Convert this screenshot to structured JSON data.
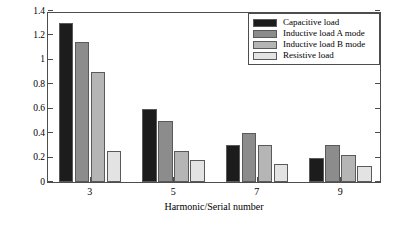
{
  "chart_data": {
    "type": "bar",
    "title": "",
    "xlabel": "Harmonic/Serial number",
    "ylabel": "Harmonic/A",
    "categories": [
      "3",
      "5",
      "7",
      "9"
    ],
    "ylim": [
      0,
      1.4
    ],
    "yticks": [
      "0",
      "0.2",
      "0.4",
      "0.6",
      "0.8",
      "1",
      "1.2",
      "1.4"
    ],
    "ytick_values": [
      0,
      0.2,
      0.4,
      0.6,
      0.8,
      1,
      1.2,
      1.4
    ],
    "grid": false,
    "legend_position": "top-right",
    "series": [
      {
        "name": "Capacitive load",
        "color": "#1c1c1c",
        "values": [
          1.3,
          0.6,
          0.3,
          0.2
        ]
      },
      {
        "name": "Inductive load A mode",
        "color": "#8c8c8c",
        "values": [
          1.15,
          0.5,
          0.4,
          0.3
        ]
      },
      {
        "name": "Inductive load B mode",
        "color": "#b5b5b5",
        "values": [
          0.9,
          0.25,
          0.3,
          0.22
        ]
      },
      {
        "name": "Resistive load",
        "color": "#e3e3e3",
        "values": [
          0.25,
          0.18,
          0.15,
          0.13
        ]
      }
    ]
  }
}
